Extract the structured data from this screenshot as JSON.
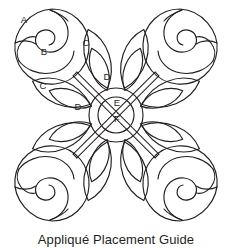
{
  "caption": "Appliqué Placement Guide",
  "colors": {
    "ink": "#231f20",
    "background": "#ffffff"
  },
  "diagram": {
    "title": "Appliqué Placement Guide",
    "type": "line-art-quilt-block-placement-diagram",
    "symmetry": "four-fold mirrored across vertical and horizontal axes",
    "center": {
      "cx": 116,
      "cy": 115,
      "outer_ring_label": "E",
      "inner_circle_label": "F",
      "outer_r": 27,
      "inner_r": 18
    },
    "labels": [
      {
        "id": "A",
        "text": "A",
        "x": 24,
        "y": 20,
        "describes": "rose outer petal / bud back"
      },
      {
        "id": "B",
        "text": "B",
        "x": 44,
        "y": 52,
        "describes": "rose inner swirl petal"
      },
      {
        "id": "C1",
        "text": "C",
        "x": 86,
        "y": 43,
        "describes": "large leaf upper"
      },
      {
        "id": "C2",
        "text": "C",
        "x": 43,
        "y": 86,
        "describes": "large leaf lower"
      },
      {
        "id": "D1",
        "text": "D",
        "x": 107,
        "y": 77,
        "describes": "small leaf vertical"
      },
      {
        "id": "D2",
        "text": "D",
        "x": 78,
        "y": 107,
        "describes": "small leaf horizontal"
      },
      {
        "id": "E",
        "text": "E",
        "x": 117,
        "y": 103,
        "describes": "outer center ring"
      },
      {
        "id": "F",
        "text": "F",
        "x": 117,
        "y": 119,
        "describes": "inner center circle"
      }
    ],
    "elements": {
      "roses": 4,
      "rose_positions": [
        "top-left",
        "top-right",
        "bottom-left",
        "bottom-right"
      ],
      "stems": 4,
      "large_leaves": 8,
      "small_leaves": 8,
      "center_circles": 2
    }
  }
}
